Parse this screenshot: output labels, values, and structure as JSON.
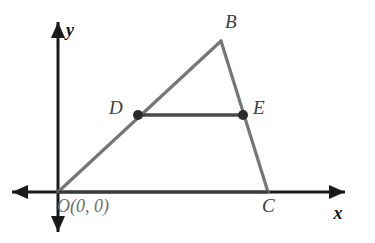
{
  "figure": {
    "background_color": "#ffffff",
    "width": 375,
    "height": 243
  },
  "colors": {
    "axis": "#1a1a1a",
    "triangle_side": "#767676",
    "midsegment": "#4a4a4a",
    "point_dot": "#2b2b2b",
    "label_vertex": "#3d3d3d",
    "label_origin": "#6b6b6b",
    "label_axis": "#111111"
  },
  "axes": {
    "x_axis": {
      "label": "x",
      "label_x": 338,
      "label_y": 219,
      "start_x": 12,
      "start_y": 192,
      "end_x": 345,
      "end_y": 192,
      "arrow_start": true,
      "arrow_end": true
    },
    "y_axis": {
      "label": "y",
      "label_x": 66,
      "label_y": 36,
      "start_x": 58,
      "start_y": 232,
      "end_x": 58,
      "end_y": 22,
      "arrow_start": true,
      "arrow_end": true
    }
  },
  "points": [
    {
      "id": "O",
      "label": "O(0, 0)",
      "x": 58,
      "y": 192,
      "label_x": 57,
      "label_y": 212,
      "dot": false,
      "role": "origin-vertex"
    },
    {
      "id": "B",
      "label": "B",
      "x": 221,
      "y": 41,
      "label_x": 225,
      "label_y": 28,
      "dot": false,
      "role": "apex-vertex"
    },
    {
      "id": "C",
      "label": "C",
      "x": 268,
      "y": 192,
      "label_x": 262,
      "label_y": 212,
      "dot": false,
      "role": "base-vertex"
    },
    {
      "id": "D",
      "label": "D",
      "x": 138,
      "y": 115,
      "label_x": 109,
      "label_y": 114,
      "dot": true,
      "role": "midpoint-of-OB"
    },
    {
      "id": "E",
      "label": "E",
      "x": 243,
      "y": 115,
      "label_x": 253,
      "label_y": 114,
      "dot": true,
      "role": "midpoint-of-BC"
    }
  ],
  "segments": [
    {
      "id": "OB",
      "from": "O",
      "to": "B",
      "x1": 58,
      "y1": 192,
      "x2": 221,
      "y2": 41,
      "style": "triangle-side"
    },
    {
      "id": "BC",
      "from": "B",
      "to": "C",
      "x1": 221,
      "y1": 41,
      "x2": 268,
      "y2": 192,
      "style": "triangle-side"
    },
    {
      "id": "OC",
      "from": "O",
      "to": "C",
      "x1": 58,
      "y1": 192,
      "x2": 268,
      "y2": 192,
      "style": "triangle-base"
    },
    {
      "id": "DE",
      "from": "D",
      "to": "E",
      "x1": 138,
      "y1": 115,
      "x2": 243,
      "y2": 115,
      "style": "midsegment"
    }
  ],
  "dot_radius": 5
}
